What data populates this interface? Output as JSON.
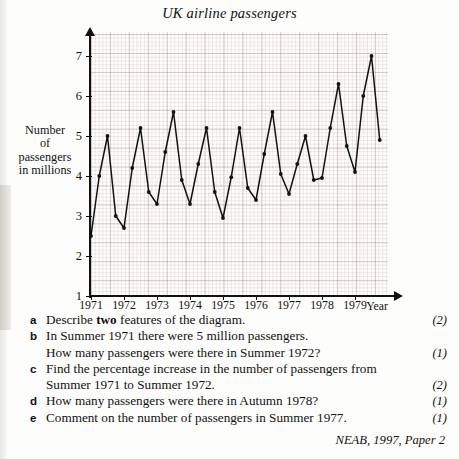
{
  "chart_data": {
    "type": "line",
    "title": "UK airline passengers",
    "xlabel": "Year",
    "ylabel": "Number of passengers in millions",
    "ylabel_lines": [
      "Number",
      "of",
      "passengers",
      "in millions"
    ],
    "ylim": [
      1,
      7.6
    ],
    "yticks": [
      1,
      2,
      3,
      4,
      5,
      6,
      7
    ],
    "xlim": [
      1971,
      1980
    ],
    "xticks": [
      1971,
      1972,
      1973,
      1974,
      1975,
      1976,
      1977,
      1978,
      1979
    ],
    "xtick_labels": [
      "1971",
      "1972",
      "1973",
      "1974",
      "1975",
      "1976",
      "1977",
      "1978",
      "1979"
    ],
    "grid": true,
    "legend": "none",
    "marker": "filled-circle",
    "series_name": "UK airline passengers (quarterly, millions)",
    "quarter_labels": [
      "Spring",
      "Summer",
      "Autumn",
      "Winter"
    ],
    "x": [
      1971.0,
      1971.25,
      1971.5,
      1971.75,
      1972.0,
      1972.25,
      1972.5,
      1972.75,
      1973.0,
      1973.25,
      1973.5,
      1973.75,
      1974.0,
      1974.25,
      1974.5,
      1974.75,
      1975.0,
      1975.25,
      1975.5,
      1975.75,
      1976.0,
      1976.25,
      1976.5,
      1976.75,
      1977.0,
      1977.25,
      1977.5,
      1977.75,
      1978.0,
      1978.25,
      1978.5,
      1978.75,
      1979.0,
      1979.25,
      1979.5,
      1979.75
    ],
    "values": [
      2.5,
      4.0,
      5.0,
      3.0,
      2.7,
      4.2,
      5.2,
      3.6,
      3.3,
      4.6,
      5.6,
      3.9,
      3.3,
      4.3,
      5.2,
      3.6,
      2.95,
      3.97,
      5.2,
      3.7,
      3.4,
      4.55,
      5.6,
      4.05,
      3.55,
      4.3,
      5.0,
      3.9,
      3.95,
      5.2,
      6.3,
      4.75,
      4.1,
      6.0,
      7.0,
      4.9
    ],
    "points": [
      {
        "year": 1971,
        "quarter": "Spring",
        "value": 2.5
      },
      {
        "year": 1971,
        "quarter": "Summer",
        "value": 4.0
      },
      {
        "year": 1971,
        "quarter": "Autumn",
        "value": 5.0
      },
      {
        "year": 1971,
        "quarter": "Winter",
        "value": 3.0
      },
      {
        "year": 1972,
        "quarter": "Spring",
        "value": 2.7
      },
      {
        "year": 1972,
        "quarter": "Summer",
        "value": 4.2
      },
      {
        "year": 1972,
        "quarter": "Autumn",
        "value": 5.2
      },
      {
        "year": 1972,
        "quarter": "Winter",
        "value": 3.6
      },
      {
        "year": 1973,
        "quarter": "Spring",
        "value": 3.3
      },
      {
        "year": 1973,
        "quarter": "Summer",
        "value": 4.6
      },
      {
        "year": 1973,
        "quarter": "Autumn",
        "value": 5.6
      },
      {
        "year": 1973,
        "quarter": "Winter",
        "value": 3.9
      },
      {
        "year": 1974,
        "quarter": "Spring",
        "value": 3.3
      },
      {
        "year": 1974,
        "quarter": "Summer",
        "value": 4.3
      },
      {
        "year": 1974,
        "quarter": "Autumn",
        "value": 5.2
      },
      {
        "year": 1974,
        "quarter": "Winter",
        "value": 3.6
      },
      {
        "year": 1975,
        "quarter": "Spring",
        "value": 2.95
      },
      {
        "year": 1975,
        "quarter": "Summer",
        "value": 3.97
      },
      {
        "year": 1975,
        "quarter": "Autumn",
        "value": 5.2
      },
      {
        "year": 1975,
        "quarter": "Winter",
        "value": 3.7
      },
      {
        "year": 1976,
        "quarter": "Spring",
        "value": 3.4
      },
      {
        "year": 1976,
        "quarter": "Summer",
        "value": 4.55
      },
      {
        "year": 1976,
        "quarter": "Autumn",
        "value": 5.6
      },
      {
        "year": 1976,
        "quarter": "Winter",
        "value": 4.05
      },
      {
        "year": 1977,
        "quarter": "Spring",
        "value": 3.55
      },
      {
        "year": 1977,
        "quarter": "Summer",
        "value": 4.3
      },
      {
        "year": 1977,
        "quarter": "Autumn",
        "value": 5.0
      },
      {
        "year": 1977,
        "quarter": "Winter",
        "value": 3.9
      },
      {
        "year": 1978,
        "quarter": "Spring",
        "value": 3.95
      },
      {
        "year": 1978,
        "quarter": "Summer",
        "value": 5.2
      },
      {
        "year": 1978,
        "quarter": "Autumn",
        "value": 6.3
      },
      {
        "year": 1978,
        "quarter": "Winter",
        "value": 4.75
      },
      {
        "year": 1979,
        "quarter": "Spring",
        "value": 4.1
      },
      {
        "year": 1979,
        "quarter": "Summer",
        "value": 6.0
      },
      {
        "year": 1979,
        "quarter": "Autumn",
        "value": 7.0
      },
      {
        "year": 1979,
        "quarter": "Winter",
        "value": 4.9
      }
    ],
    "colors": {
      "line": "#111111",
      "marker": "#111111",
      "major_grid": "#9b7a7a",
      "minor_grid": "#b08686",
      "axis": "#111111",
      "background": "#fdfdfb"
    }
  },
  "questions": [
    {
      "letter": "a",
      "lines": [
        {
          "pre": "Describe ",
          "bold": "two",
          "post": " features of the diagram.",
          "marks": "(2)"
        }
      ]
    },
    {
      "letter": "b",
      "lines": [
        {
          "pre": "In Summer 1971 there were 5 million passengers.",
          "bold": "",
          "post": "",
          "marks": ""
        },
        {
          "pre": "How many passengers were there in Summer 1972?",
          "bold": "",
          "post": "",
          "marks": "(1)"
        }
      ]
    },
    {
      "letter": "c",
      "lines": [
        {
          "pre": "Find the percentage increase in the number of passengers from",
          "bold": "",
          "post": "",
          "marks": ""
        },
        {
          "pre": "Summer 1971 to Summer 1972.",
          "bold": "",
          "post": "",
          "marks": "(2)"
        }
      ]
    },
    {
      "letter": "d",
      "lines": [
        {
          "pre": "How many passengers were there in Autumn 1978?",
          "bold": "",
          "post": "",
          "marks": "(1)"
        }
      ]
    },
    {
      "letter": "e",
      "lines": [
        {
          "pre": "Comment on the number of passengers in Summer 1977.",
          "bold": "",
          "post": "",
          "marks": "(1)"
        }
      ]
    }
  ],
  "source": "NEAB, 1997, Paper 2"
}
